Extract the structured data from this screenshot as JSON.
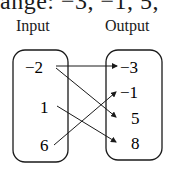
{
  "top_text": "ange:   −3,  −1, 5, ",
  "input_title": "Input",
  "output_title": "Output",
  "inputs": [
    "−2",
    "1",
    "6"
  ],
  "outputs": [
    "−3",
    "−1",
    "5",
    "8"
  ],
  "mappings": [
    {
      "from": "−2",
      "to": "−3"
    },
    {
      "from": "−2",
      "to": "5"
    },
    {
      "from": "1",
      "to": "8"
    },
    {
      "from": "6",
      "to": "−1"
    }
  ],
  "colors": {
    "stroke": "#1a1a1a",
    "background": "#ffffff"
  }
}
